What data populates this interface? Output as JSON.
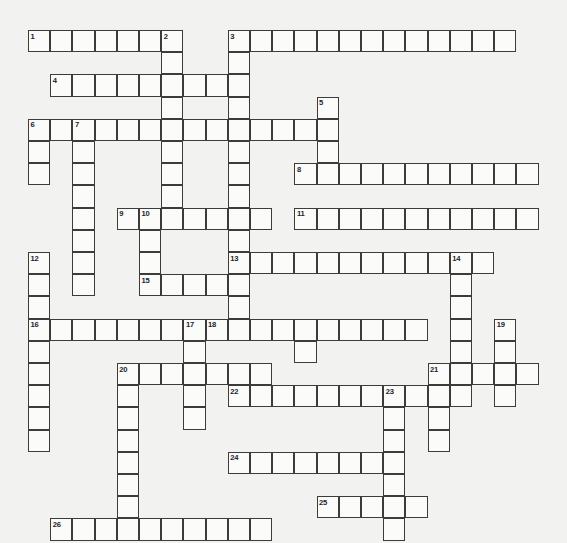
{
  "puzzle": {
    "title": "Crossword Puzzle Grid",
    "type": "crossword-grid",
    "background_color": "#f2f2f0",
    "cell_fill_color": "#fbfbfa",
    "cell_border_color": "#3c3c3c",
    "number_color": "#23232a",
    "cell_size_px": 22.2,
    "origin_x_px": 28,
    "origin_y_px": 30,
    "columns": 24,
    "rows": 23,
    "total_entries": 26,
    "entry_numbers": [
      1,
      2,
      3,
      4,
      5,
      6,
      7,
      8,
      9,
      10,
      11,
      12,
      13,
      14,
      15,
      16,
      17,
      18,
      19,
      20,
      21,
      22,
      23,
      24,
      25,
      26
    ],
    "entries": [
      {
        "number": "1",
        "direction": "across",
        "col": 0,
        "row": 0,
        "length": 7
      },
      {
        "number": "2",
        "direction": "down",
        "col": 6,
        "row": 0,
        "length": 10
      },
      {
        "number": "3",
        "direction": "across",
        "col": 9,
        "row": 0,
        "length": 13
      },
      {
        "number": "3",
        "direction": "down",
        "col": 9,
        "row": 0,
        "length": 17
      },
      {
        "number": "4",
        "direction": "across",
        "col": 1,
        "row": 2,
        "length": 9
      },
      {
        "number": "5",
        "direction": "down",
        "col": 13,
        "row": 3,
        "length": 5
      },
      {
        "number": "6",
        "direction": "across",
        "col": 0,
        "row": 4,
        "length": 13
      },
      {
        "number": "6",
        "direction": "down",
        "col": 0,
        "row": 4,
        "length": 3
      },
      {
        "number": "7",
        "direction": "down",
        "col": 2,
        "row": 4,
        "length": 8
      },
      {
        "number": "8",
        "direction": "across",
        "col": 12,
        "row": 6,
        "length": 11
      },
      {
        "number": "9",
        "direction": "across",
        "col": 4,
        "row": 8,
        "length": 7
      },
      {
        "number": "10",
        "direction": "down",
        "col": 5,
        "row": 8,
        "length": 5
      },
      {
        "number": "11",
        "direction": "across",
        "col": 12,
        "row": 8,
        "length": 11
      },
      {
        "number": "12",
        "direction": "down",
        "col": 0,
        "row": 10,
        "length": 4
      },
      {
        "number": "13",
        "direction": "across",
        "col": 9,
        "row": 10,
        "length": 11
      },
      {
        "number": "14",
        "direction": "down",
        "col": 19,
        "row": 10,
        "length": 5
      },
      {
        "number": "15",
        "direction": "across",
        "col": 5,
        "row": 11,
        "length": 5
      },
      {
        "number": "16",
        "direction": "across",
        "col": 0,
        "row": 13,
        "length": 8
      },
      {
        "number": "16",
        "direction": "down",
        "col": 0,
        "row": 13,
        "length": 6
      },
      {
        "number": "17",
        "direction": "down",
        "col": 7,
        "row": 13,
        "length": 5
      },
      {
        "number": "18",
        "direction": "across",
        "col": 8,
        "row": 13,
        "length": 10
      },
      {
        "number": "19",
        "direction": "down",
        "col": 21,
        "row": 13,
        "length": 4
      },
      {
        "number": "20",
        "direction": "down",
        "col": 4,
        "row": 15,
        "length": 8
      },
      {
        "number": "20",
        "direction": "across",
        "col": 4,
        "row": 15,
        "length": 7
      },
      {
        "number": "21",
        "direction": "across",
        "col": 18,
        "row": 15,
        "length": 5
      },
      {
        "number": "22",
        "direction": "across",
        "col": 9,
        "row": 16,
        "length": 11
      },
      {
        "number": "23",
        "direction": "down",
        "col": 16,
        "row": 16,
        "length": 7
      },
      {
        "number": "24",
        "direction": "across",
        "col": 9,
        "row": 19,
        "length": 8
      },
      {
        "number": "25",
        "direction": "across",
        "col": 13,
        "row": 21,
        "length": 5
      },
      {
        "number": "26",
        "direction": "across",
        "col": 1,
        "row": 22,
        "length": 10
      }
    ],
    "cells": [
      {
        "c": 0,
        "r": 0,
        "n": "1"
      },
      {
        "c": 1,
        "r": 0,
        "n": ""
      },
      {
        "c": 2,
        "r": 0,
        "n": ""
      },
      {
        "c": 3,
        "r": 0,
        "n": ""
      },
      {
        "c": 4,
        "r": 0,
        "n": ""
      },
      {
        "c": 5,
        "r": 0,
        "n": ""
      },
      {
        "c": 6,
        "r": 0,
        "n": "2"
      },
      {
        "c": 9,
        "r": 0,
        "n": "3"
      },
      {
        "c": 10,
        "r": 0,
        "n": ""
      },
      {
        "c": 11,
        "r": 0,
        "n": ""
      },
      {
        "c": 12,
        "r": 0,
        "n": ""
      },
      {
        "c": 13,
        "r": 0,
        "n": ""
      },
      {
        "c": 14,
        "r": 0,
        "n": ""
      },
      {
        "c": 15,
        "r": 0,
        "n": ""
      },
      {
        "c": 16,
        "r": 0,
        "n": ""
      },
      {
        "c": 17,
        "r": 0,
        "n": ""
      },
      {
        "c": 18,
        "r": 0,
        "n": ""
      },
      {
        "c": 19,
        "r": 0,
        "n": ""
      },
      {
        "c": 20,
        "r": 0,
        "n": ""
      },
      {
        "c": 21,
        "r": 0,
        "n": ""
      },
      {
        "c": 6,
        "r": 1,
        "n": ""
      },
      {
        "c": 9,
        "r": 1,
        "n": ""
      },
      {
        "c": 1,
        "r": 2,
        "n": "4"
      },
      {
        "c": 2,
        "r": 2,
        "n": ""
      },
      {
        "c": 3,
        "r": 2,
        "n": ""
      },
      {
        "c": 4,
        "r": 2,
        "n": ""
      },
      {
        "c": 5,
        "r": 2,
        "n": ""
      },
      {
        "c": 6,
        "r": 2,
        "n": ""
      },
      {
        "c": 7,
        "r": 2,
        "n": ""
      },
      {
        "c": 8,
        "r": 2,
        "n": ""
      },
      {
        "c": 9,
        "r": 2,
        "n": ""
      },
      {
        "c": 6,
        "r": 3,
        "n": ""
      },
      {
        "c": 9,
        "r": 3,
        "n": ""
      },
      {
        "c": 13,
        "r": 3,
        "n": "5"
      },
      {
        "c": 0,
        "r": 4,
        "n": "6"
      },
      {
        "c": 1,
        "r": 4,
        "n": ""
      },
      {
        "c": 2,
        "r": 4,
        "n": "7"
      },
      {
        "c": 3,
        "r": 4,
        "n": ""
      },
      {
        "c": 4,
        "r": 4,
        "n": ""
      },
      {
        "c": 5,
        "r": 4,
        "n": ""
      },
      {
        "c": 6,
        "r": 4,
        "n": ""
      },
      {
        "c": 7,
        "r": 4,
        "n": ""
      },
      {
        "c": 8,
        "r": 4,
        "n": ""
      },
      {
        "c": 9,
        "r": 4,
        "n": ""
      },
      {
        "c": 10,
        "r": 4,
        "n": ""
      },
      {
        "c": 11,
        "r": 4,
        "n": ""
      },
      {
        "c": 12,
        "r": 4,
        "n": ""
      },
      {
        "c": 13,
        "r": 4,
        "n": ""
      },
      {
        "c": 0,
        "r": 5,
        "n": ""
      },
      {
        "c": 2,
        "r": 5,
        "n": ""
      },
      {
        "c": 6,
        "r": 5,
        "n": ""
      },
      {
        "c": 9,
        "r": 5,
        "n": ""
      },
      {
        "c": 13,
        "r": 5,
        "n": ""
      },
      {
        "c": 0,
        "r": 6,
        "n": ""
      },
      {
        "c": 2,
        "r": 6,
        "n": ""
      },
      {
        "c": 6,
        "r": 6,
        "n": ""
      },
      {
        "c": 9,
        "r": 6,
        "n": ""
      },
      {
        "c": 12,
        "r": 6,
        "n": "8"
      },
      {
        "c": 13,
        "r": 6,
        "n": ""
      },
      {
        "c": 14,
        "r": 6,
        "n": ""
      },
      {
        "c": 15,
        "r": 6,
        "n": ""
      },
      {
        "c": 16,
        "r": 6,
        "n": ""
      },
      {
        "c": 17,
        "r": 6,
        "n": ""
      },
      {
        "c": 18,
        "r": 6,
        "n": ""
      },
      {
        "c": 19,
        "r": 6,
        "n": ""
      },
      {
        "c": 20,
        "r": 6,
        "n": ""
      },
      {
        "c": 21,
        "r": 6,
        "n": ""
      },
      {
        "c": 22,
        "r": 6,
        "n": ""
      },
      {
        "c": 2,
        "r": 7,
        "n": ""
      },
      {
        "c": 6,
        "r": 7,
        "n": ""
      },
      {
        "c": 9,
        "r": 7,
        "n": ""
      },
      {
        "c": 2,
        "r": 8,
        "n": ""
      },
      {
        "c": 4,
        "r": 8,
        "n": "9"
      },
      {
        "c": 5,
        "r": 8,
        "n": "10"
      },
      {
        "c": 6,
        "r": 8,
        "n": ""
      },
      {
        "c": 7,
        "r": 8,
        "n": ""
      },
      {
        "c": 8,
        "r": 8,
        "n": ""
      },
      {
        "c": 9,
        "r": 8,
        "n": ""
      },
      {
        "c": 10,
        "r": 8,
        "n": ""
      },
      {
        "c": 12,
        "r": 8,
        "n": "11"
      },
      {
        "c": 13,
        "r": 8,
        "n": ""
      },
      {
        "c": 14,
        "r": 8,
        "n": ""
      },
      {
        "c": 15,
        "r": 8,
        "n": ""
      },
      {
        "c": 16,
        "r": 8,
        "n": ""
      },
      {
        "c": 17,
        "r": 8,
        "n": ""
      },
      {
        "c": 18,
        "r": 8,
        "n": ""
      },
      {
        "c": 19,
        "r": 8,
        "n": ""
      },
      {
        "c": 20,
        "r": 8,
        "n": ""
      },
      {
        "c": 21,
        "r": 8,
        "n": ""
      },
      {
        "c": 22,
        "r": 8,
        "n": ""
      },
      {
        "c": 2,
        "r": 9,
        "n": ""
      },
      {
        "c": 5,
        "r": 9,
        "n": ""
      },
      {
        "c": 9,
        "r": 9,
        "n": ""
      },
      {
        "c": 0,
        "r": 10,
        "n": "12"
      },
      {
        "c": 2,
        "r": 10,
        "n": ""
      },
      {
        "c": 5,
        "r": 10,
        "n": ""
      },
      {
        "c": 9,
        "r": 10,
        "n": "13"
      },
      {
        "c": 10,
        "r": 10,
        "n": ""
      },
      {
        "c": 11,
        "r": 10,
        "n": ""
      },
      {
        "c": 12,
        "r": 10,
        "n": ""
      },
      {
        "c": 13,
        "r": 10,
        "n": ""
      },
      {
        "c": 14,
        "r": 10,
        "n": ""
      },
      {
        "c": 15,
        "r": 10,
        "n": ""
      },
      {
        "c": 16,
        "r": 10,
        "n": ""
      },
      {
        "c": 17,
        "r": 10,
        "n": ""
      },
      {
        "c": 18,
        "r": 10,
        "n": ""
      },
      {
        "c": 19,
        "r": 10,
        "n": "14"
      },
      {
        "c": 20,
        "r": 10,
        "n": ""
      },
      {
        "c": 0,
        "r": 11,
        "n": ""
      },
      {
        "c": 2,
        "r": 11,
        "n": ""
      },
      {
        "c": 5,
        "r": 11,
        "n": "15"
      },
      {
        "c": 6,
        "r": 11,
        "n": ""
      },
      {
        "c": 7,
        "r": 11,
        "n": ""
      },
      {
        "c": 8,
        "r": 11,
        "n": ""
      },
      {
        "c": 9,
        "r": 11,
        "n": ""
      },
      {
        "c": 19,
        "r": 11,
        "n": ""
      },
      {
        "c": 0,
        "r": 12,
        "n": ""
      },
      {
        "c": 9,
        "r": 12,
        "n": ""
      },
      {
        "c": 19,
        "r": 12,
        "n": ""
      },
      {
        "c": 0,
        "r": 13,
        "n": "16"
      },
      {
        "c": 1,
        "r": 13,
        "n": ""
      },
      {
        "c": 2,
        "r": 13,
        "n": ""
      },
      {
        "c": 3,
        "r": 13,
        "n": ""
      },
      {
        "c": 4,
        "r": 13,
        "n": ""
      },
      {
        "c": 5,
        "r": 13,
        "n": ""
      },
      {
        "c": 6,
        "r": 13,
        "n": ""
      },
      {
        "c": 7,
        "r": 13,
        "n": "17"
      },
      {
        "c": 8,
        "r": 13,
        "n": "18"
      },
      {
        "c": 9,
        "r": 13,
        "n": ""
      },
      {
        "c": 10,
        "r": 13,
        "n": ""
      },
      {
        "c": 11,
        "r": 13,
        "n": ""
      },
      {
        "c": 12,
        "r": 13,
        "n": ""
      },
      {
        "c": 13,
        "r": 13,
        "n": ""
      },
      {
        "c": 14,
        "r": 13,
        "n": ""
      },
      {
        "c": 15,
        "r": 13,
        "n": ""
      },
      {
        "c": 16,
        "r": 13,
        "n": ""
      },
      {
        "c": 17,
        "r": 13,
        "n": ""
      },
      {
        "c": 19,
        "r": 13,
        "n": ""
      },
      {
        "c": 21,
        "r": 13,
        "n": "19"
      },
      {
        "c": 0,
        "r": 14,
        "n": ""
      },
      {
        "c": 7,
        "r": 14,
        "n": ""
      },
      {
        "c": 12,
        "r": 14,
        "n": ""
      },
      {
        "c": 19,
        "r": 14,
        "n": ""
      },
      {
        "c": 21,
        "r": 14,
        "n": ""
      },
      {
        "c": 0,
        "r": 15,
        "n": ""
      },
      {
        "c": 4,
        "r": 15,
        "n": "20"
      },
      {
        "c": 5,
        "r": 15,
        "n": ""
      },
      {
        "c": 6,
        "r": 15,
        "n": ""
      },
      {
        "c": 7,
        "r": 15,
        "n": ""
      },
      {
        "c": 8,
        "r": 15,
        "n": ""
      },
      {
        "c": 9,
        "r": 15,
        "n": ""
      },
      {
        "c": 10,
        "r": 15,
        "n": ""
      },
      {
        "c": 18,
        "r": 15,
        "n": "21"
      },
      {
        "c": 19,
        "r": 15,
        "n": ""
      },
      {
        "c": 20,
        "r": 15,
        "n": ""
      },
      {
        "c": 21,
        "r": 15,
        "n": ""
      },
      {
        "c": 22,
        "r": 15,
        "n": ""
      },
      {
        "c": 0,
        "r": 16,
        "n": ""
      },
      {
        "c": 4,
        "r": 16,
        "n": ""
      },
      {
        "c": 7,
        "r": 16,
        "n": ""
      },
      {
        "c": 9,
        "r": 16,
        "n": "22"
      },
      {
        "c": 10,
        "r": 16,
        "n": ""
      },
      {
        "c": 11,
        "r": 16,
        "n": ""
      },
      {
        "c": 12,
        "r": 16,
        "n": ""
      },
      {
        "c": 13,
        "r": 16,
        "n": ""
      },
      {
        "c": 14,
        "r": 16,
        "n": ""
      },
      {
        "c": 15,
        "r": 16,
        "n": ""
      },
      {
        "c": 16,
        "r": 16,
        "n": "23"
      },
      {
        "c": 17,
        "r": 16,
        "n": ""
      },
      {
        "c": 18,
        "r": 16,
        "n": ""
      },
      {
        "c": 19,
        "r": 16,
        "n": ""
      },
      {
        "c": 21,
        "r": 16,
        "n": ""
      },
      {
        "c": 0,
        "r": 17,
        "n": ""
      },
      {
        "c": 4,
        "r": 17,
        "n": ""
      },
      {
        "c": 7,
        "r": 17,
        "n": ""
      },
      {
        "c": 16,
        "r": 17,
        "n": ""
      },
      {
        "c": 18,
        "r": 17,
        "n": ""
      },
      {
        "c": 0,
        "r": 18,
        "n": ""
      },
      {
        "c": 4,
        "r": 18,
        "n": ""
      },
      {
        "c": 16,
        "r": 18,
        "n": ""
      },
      {
        "c": 18,
        "r": 18,
        "n": ""
      },
      {
        "c": 4,
        "r": 19,
        "n": ""
      },
      {
        "c": 9,
        "r": 19,
        "n": "24"
      },
      {
        "c": 10,
        "r": 19,
        "n": ""
      },
      {
        "c": 11,
        "r": 19,
        "n": ""
      },
      {
        "c": 12,
        "r": 19,
        "n": ""
      },
      {
        "c": 13,
        "r": 19,
        "n": ""
      },
      {
        "c": 14,
        "r": 19,
        "n": ""
      },
      {
        "c": 15,
        "r": 19,
        "n": ""
      },
      {
        "c": 16,
        "r": 19,
        "n": ""
      },
      {
        "c": 4,
        "r": 20,
        "n": ""
      },
      {
        "c": 16,
        "r": 20,
        "n": ""
      },
      {
        "c": 4,
        "r": 21,
        "n": ""
      },
      {
        "c": 13,
        "r": 21,
        "n": "25"
      },
      {
        "c": 14,
        "r": 21,
        "n": ""
      },
      {
        "c": 15,
        "r": 21,
        "n": ""
      },
      {
        "c": 16,
        "r": 21,
        "n": ""
      },
      {
        "c": 17,
        "r": 21,
        "n": ""
      },
      {
        "c": 1,
        "r": 22,
        "n": "26"
      },
      {
        "c": 2,
        "r": 22,
        "n": ""
      },
      {
        "c": 3,
        "r": 22,
        "n": ""
      },
      {
        "c": 4,
        "r": 22,
        "n": ""
      },
      {
        "c": 5,
        "r": 22,
        "n": ""
      },
      {
        "c": 6,
        "r": 22,
        "n": ""
      },
      {
        "c": 7,
        "r": 22,
        "n": ""
      },
      {
        "c": 8,
        "r": 22,
        "n": ""
      },
      {
        "c": 9,
        "r": 22,
        "n": ""
      },
      {
        "c": 10,
        "r": 22,
        "n": ""
      },
      {
        "c": 16,
        "r": 22,
        "n": ""
      }
    ]
  }
}
